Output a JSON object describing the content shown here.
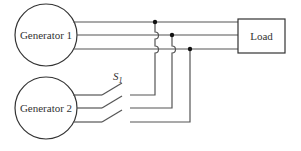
{
  "diagram": {
    "title": "",
    "nodes": [
      {
        "id": "gen1",
        "label": "Generator 1",
        "shape": "circle"
      },
      {
        "id": "gen2",
        "label": "Generator 2",
        "shape": "circle"
      },
      {
        "id": "load",
        "label": "Load",
        "shape": "rectangle"
      }
    ],
    "switch": {
      "id": "S1",
      "label": "S",
      "subscript": "1",
      "state": "open"
    },
    "phases": 3,
    "connections": [
      {
        "from": "gen1",
        "to": "load",
        "type": "3-phase bus"
      },
      {
        "from": "gen2",
        "to": "S1",
        "type": "3-phase"
      },
      {
        "from": "S1",
        "to": "bus",
        "type": "3-phase, tapped at junction dots"
      }
    ],
    "colors": {
      "line": "#555555",
      "text": "#333333",
      "junction": "#111111"
    }
  }
}
